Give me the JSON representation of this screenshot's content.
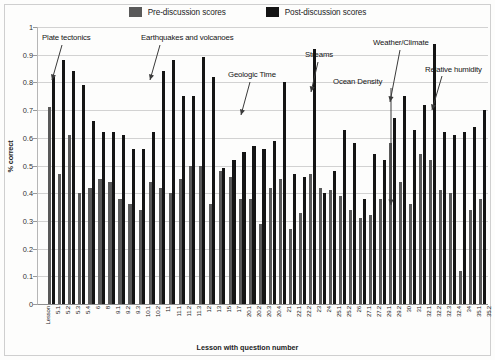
{
  "chart_data": {
    "type": "bar",
    "title": "",
    "xlabel": "Lesson with question number",
    "ylabel": "% correct",
    "ylim": [
      0,
      1
    ],
    "ytick_values": [
      0,
      0.1,
      0.2,
      0.3,
      0.4,
      0.5,
      0.6,
      0.7,
      0.8,
      0.9,
      1
    ],
    "ytick_labels": [
      "0",
      "0.1",
      "0.2",
      "0.3",
      "0.4",
      "0.5",
      "0.6",
      "0.7",
      "0.8",
      "0.9",
      "1"
    ],
    "grid": true,
    "legend_position": "top-center",
    "legend": [
      "Pre-discussion scores",
      "Post-discussion scores"
    ],
    "categories": [
      "Lesson",
      "5.1",
      "5.2",
      "5.3",
      "5.4",
      "6",
      "8",
      "9.1",
      "9.2",
      "9.3",
      "10.1",
      "10.2",
      "11",
      "11.1",
      "11.2",
      "11.3",
      "12",
      "13",
      "15",
      "17",
      "20.1",
      "20.2",
      "20.3",
      "20.4",
      "21",
      "22.1",
      "22.2",
      "23",
      "24",
      "25.1",
      "25.2",
      "26",
      "27.1",
      "27.2",
      "29.1",
      "29.2",
      "30",
      "31",
      "32.1",
      "32.2",
      "32.3",
      "32.4",
      "34",
      "35.1",
      "35.2"
    ],
    "series": [
      {
        "name": "Pre-discussion scores",
        "color": "#595959",
        "values": [
          null,
          0.71,
          0.47,
          0.61,
          0.4,
          0.42,
          0.45,
          0.44,
          0.38,
          0.36,
          0.34,
          0.44,
          0.42,
          0.4,
          0.45,
          0.5,
          0.5,
          0.36,
          0.48,
          0.46,
          0.38,
          0.38,
          0.29,
          0.42,
          0.45,
          0.27,
          0.33,
          0.47,
          0.42,
          0.41,
          0.39,
          0.34,
          0.31,
          0.32,
          0.38,
          0.58,
          0.44,
          0.36,
          0.54,
          0.52,
          0.41,
          0.4,
          0.12,
          0.34,
          0.38
        ]
      },
      {
        "name": "Post-discussion scores",
        "color": "#141414",
        "values": [
          null,
          0.82,
          0.88,
          0.84,
          0.79,
          0.66,
          0.62,
          0.62,
          0.61,
          0.56,
          0.56,
          0.62,
          0.84,
          0.88,
          0.75,
          0.75,
          0.89,
          0.82,
          0.49,
          0.52,
          0.55,
          0.57,
          0.56,
          0.59,
          0.8,
          0.47,
          0.46,
          0.92,
          0.4,
          0.48,
          0.63,
          0.58,
          0.38,
          0.54,
          0.52,
          0.67,
          0.75,
          0.63,
          0.72,
          0.94,
          0.62,
          0.61,
          0.62,
          0.64,
          0.7
        ]
      }
    ],
    "annotations": [
      {
        "text": "Plate tectonics",
        "label_x": 42,
        "label_y": 33,
        "tip_x": 52,
        "tip_y": 80,
        "arrow_from_x": 62,
        "arrow_from_y": 45
      },
      {
        "text": "Earthquakes and volcanoes",
        "label_x": 141,
        "label_y": 33,
        "tip_x": 150,
        "tip_y": 80,
        "arrow_from_x": 160,
        "arrow_from_y": 45
      },
      {
        "text": "Geologic Time",
        "label_x": 228,
        "label_y": 70,
        "tip_x": 241,
        "tip_y": 115,
        "arrow_from_x": 250,
        "arrow_from_y": 82
      },
      {
        "text": "Streams",
        "label_x": 305,
        "label_y": 50,
        "tip_x": 311,
        "tip_y": 92,
        "arrow_from_x": 318,
        "arrow_from_y": 62
      },
      {
        "text": "Ocean Density",
        "label_x": 333,
        "label_y": 77,
        "tip_x": 391,
        "tip_y": 205,
        "arrow_from_x": 391,
        "arrow_from_y": 88
      },
      {
        "text": "Weather/Climate",
        "label_x": 373,
        "label_y": 38,
        "tip_x": 390,
        "tip_y": 102,
        "arrow_from_x": 400,
        "arrow_from_y": 50
      },
      {
        "text": "Relative humidity",
        "label_x": 425,
        "label_y": 65,
        "tip_x": 432,
        "tip_y": 110,
        "arrow_from_x": 442,
        "arrow_from_y": 76
      }
    ]
  }
}
